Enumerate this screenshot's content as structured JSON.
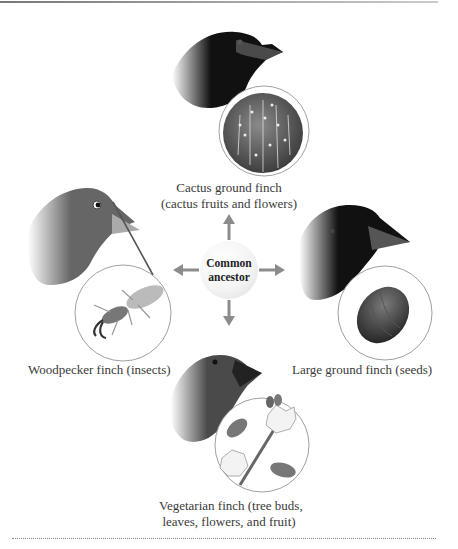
{
  "figure": {
    "center": {
      "line1": "Common",
      "line2": "ancestor"
    },
    "finches": [
      {
        "name": "cactus-ground-finch",
        "label_line1": "Cactus ground finch",
        "label_line2": "(cactus fruits and flowers)",
        "food": "cactus",
        "head_color": "#111111"
      },
      {
        "name": "woodpecker-finch",
        "label_line1": "Woodpecker finch (insects)",
        "food": "insect",
        "head_color": "#8a8a8a"
      },
      {
        "name": "large-ground-finch",
        "label_line1": "Large ground finch (seeds)",
        "food": "seed",
        "head_color": "#0d0d0d"
      },
      {
        "name": "vegetarian-finch",
        "label_line1": "Vegetarian finch (tree buds,",
        "label_line2": "leaves, flowers, and fruit)",
        "food": "flowers",
        "head_color": "#5a5a5a"
      }
    ],
    "arrow_color": "#8c8c8c",
    "circle_stroke": "#a0a0a0"
  }
}
